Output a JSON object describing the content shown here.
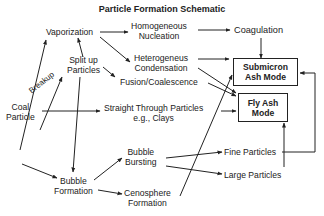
{
  "title": "Particle Formation Schematic",
  "nodes": {
    "vaporization": "Vaporization",
    "homogeneous_l1": "Homogeneous",
    "homogeneous_l2": "Nucleation",
    "coagulation": "Coagulation",
    "split_l1": "Split up",
    "split_l2": "Particles",
    "heterogeneous_l1": "Heterogeneus",
    "heterogeneous_l2": "Condensation",
    "fusion": "Fusion/Coalescence",
    "breakup": "Breakup",
    "coal_l1": "Coal",
    "coal_l2": "Particle",
    "straight_l1": "Straight Through Particles",
    "straight_l2": "e.g., Clays",
    "submicron_l1": "Submicron",
    "submicron_l2": "Ash Mode",
    "flyash_l1": "Fly Ash",
    "flyash_l2": "Mode",
    "bubble_bursting_l1": "Bubble",
    "bubble_bursting_l2": "Bursting",
    "fine_particles": "Fine Particles",
    "large_particles": "Large Particles",
    "bubble_formation_l1": "Bubble",
    "bubble_formation_l2": "Formation",
    "cenosphere_l1": "Cenosphere",
    "cenosphere_l2": "Formation"
  },
  "edges": [
    {
      "from": "Coal Particle",
      "to": "Vaporization"
    },
    {
      "from": "Coal Particle",
      "to": "Split up Particles",
      "label": "Breakup"
    },
    {
      "from": "Split up Particles",
      "to": "Vaporization"
    },
    {
      "from": "Vaporization",
      "to": "Homogeneous Nucleation"
    },
    {
      "from": "Vaporization",
      "to": "Heterogeneus Condensation"
    },
    {
      "from": "Homogeneous Nucleation",
      "to": "Coagulation"
    },
    {
      "from": "Coagulation",
      "to": "Submicron Ash Mode"
    },
    {
      "from": "Heterogeneus Condensation",
      "to": "Submicron Ash Mode"
    },
    {
      "from": "Heterogeneus Condensation",
      "to": "Fly Ash Mode"
    },
    {
      "from": "Split up Particles",
      "to": "Fusion/Coalescence"
    },
    {
      "from": "Fusion/Coalescence",
      "to": "Fly Ash Mode"
    },
    {
      "from": "Cenosphere Formation",
      "to": "Submicron Ash Mode"
    },
    {
      "from": "Coal Particle",
      "to": "Straight Through Particles"
    },
    {
      "from": "Straight Through Particles",
      "to": "Fly Ash Mode"
    },
    {
      "from": "Coal Particle",
      "to": "Bubble Formation"
    },
    {
      "from": "Split up Particles",
      "to": "Bubble Formation"
    },
    {
      "from": "Bubble Formation",
      "to": "Bubble Bursting"
    },
    {
      "from": "Bubble Formation",
      "to": "Cenosphere Formation"
    },
    {
      "from": "Bubble Bursting",
      "to": "Fine Particles"
    },
    {
      "from": "Bubble Bursting",
      "to": "Large Particles"
    },
    {
      "from": "Fine Particles",
      "to": "Submicron Ash Mode"
    },
    {
      "from": "Large Particles",
      "to": "Fly Ash Mode"
    },
    {
      "from": "Cenosphere Formation",
      "to": "Fly Ash Mode"
    }
  ]
}
